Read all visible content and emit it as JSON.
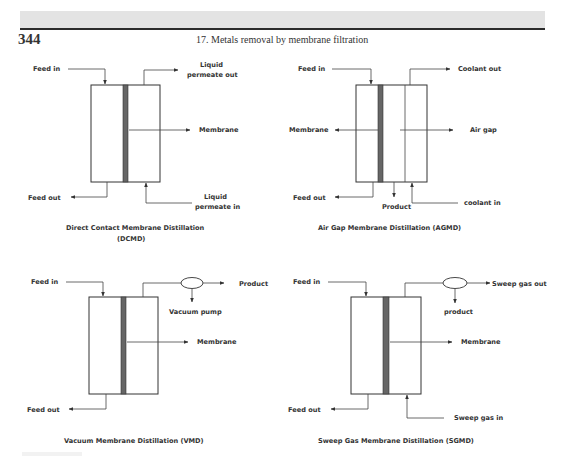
{
  "header": {
    "page_number": "344",
    "running_title": "17. Metals removal by membrane filtration"
  },
  "diagrams": {
    "dcmd": {
      "caption_line1": "Direct Contact Membrane Distillation",
      "caption_line2": "(DCMD)",
      "feed_in": "Feed in",
      "feed_out": "Feed out",
      "permeate_out_1": "Liquid",
      "permeate_out_2": "permeate out",
      "membrane": "Membrane",
      "permeate_in_1": "Liquid",
      "permeate_in_2": "permeate in"
    },
    "agmd": {
      "caption": "Air Gap Membrane Distillation (AGMD)",
      "feed_in": "Feed in",
      "feed_out": "Feed out",
      "coolant_out": "Coolant out",
      "membrane": "Membrane",
      "air_gap": "Air gap",
      "product": "Product",
      "coolant_in": "coolant in"
    },
    "vmd": {
      "caption": "Vacuum Membrane Distillation (VMD)",
      "feed_in": "Feed in",
      "feed_out": "Feed out",
      "product": "Product",
      "vacuum_pump": "Vacuum pump",
      "membrane": "Membrane"
    },
    "sgmd": {
      "caption": "Sweep Gas Membrane Distillation (SGMD)",
      "feed_in": "Feed in",
      "feed_out": "Feed out",
      "sweep_gas_out": "Sweep gas out",
      "product": "product",
      "membrane": "Membrane",
      "sweep_gas_in": "Sweep gas in"
    }
  },
  "colors": {
    "header_band": "#e3e3e3",
    "rule": "#2b2b2b",
    "membrane": "#666666",
    "text": "#333333"
  }
}
